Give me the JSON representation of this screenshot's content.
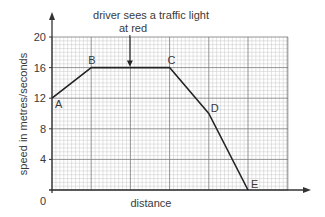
{
  "chart_data": {
    "type": "line",
    "title": "driver sees a traffic light at red",
    "title_lines": [
      "driver sees a traffic light",
      "at red"
    ],
    "xlabel": "distance",
    "ylabel": "speed in metres/seconds",
    "xlim": [
      0,
      6
    ],
    "ylim": [
      0,
      20
    ],
    "y_ticks": [
      0,
      4,
      8,
      12,
      16,
      20
    ],
    "y_tick_labels": [
      "4",
      "8",
      "12",
      "16",
      "20"
    ],
    "origin_label": "0",
    "x_ticks_labeled": false,
    "grid": true,
    "legend": null,
    "series": [
      {
        "name": "speed",
        "points": [
          {
            "label": "A",
            "x": 0,
            "y": 12
          },
          {
            "label": "B",
            "x": 1,
            "y": 16
          },
          {
            "label": "C",
            "x": 3,
            "y": 16
          },
          {
            "label": "D",
            "x": 4,
            "y": 10
          },
          {
            "label": "E",
            "x": 5,
            "y": 0
          }
        ]
      }
    ],
    "annotations": [
      {
        "text": "driver sees a traffic light at red",
        "x": 2,
        "y": 16,
        "type": "arrow-down"
      }
    ]
  }
}
